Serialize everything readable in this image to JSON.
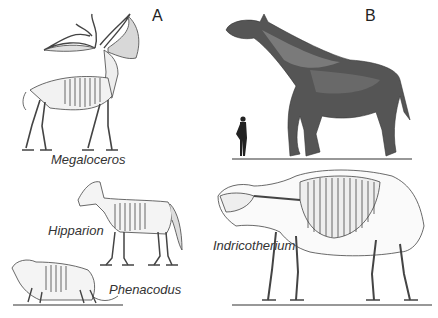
{
  "figure": {
    "panels": [
      {
        "id": "A",
        "label": "A"
      },
      {
        "id": "B",
        "label": "B"
      }
    ],
    "specimens": {
      "megaloceros": "Megaloceros",
      "hipparion": "Hipparion",
      "phenacodus": "Phenacodus",
      "indricotherium": "Indricotherium"
    }
  }
}
